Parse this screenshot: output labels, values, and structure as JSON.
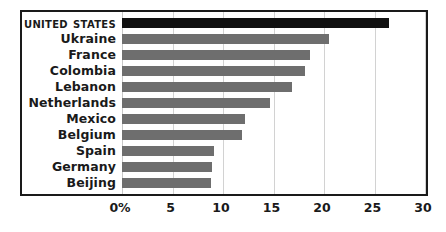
{
  "chart_data": {
    "type": "bar",
    "orientation": "horizontal",
    "title": "",
    "subtitle": "",
    "xlabel": "",
    "ylabel": "",
    "categories": [
      "United States",
      "Ukraine",
      "France",
      "Colombia",
      "Lebanon",
      "Netherlands",
      "Mexico",
      "Belgium",
      "Spain",
      "Germany",
      "Beijing"
    ],
    "values": [
      26.4,
      20.5,
      18.6,
      18.1,
      16.8,
      14.7,
      12.2,
      11.9,
      9.1,
      8.9,
      8.8
    ],
    "highlight_category": "United States",
    "xlim": [
      0,
      30
    ],
    "xticks": [
      0,
      5,
      10,
      15,
      20,
      25,
      30
    ],
    "xtick_labels": [
      "0%",
      "5",
      "10",
      "15",
      "20",
      "25",
      "30"
    ],
    "grid": true,
    "legend": false,
    "colors": {
      "bar": "#6e6e6e",
      "bar_highlight": "#111111",
      "gridline": "#d2d2d2",
      "frame": "#1a1a1a",
      "text": "#1a1a1a",
      "background": "#ffffff"
    }
  }
}
